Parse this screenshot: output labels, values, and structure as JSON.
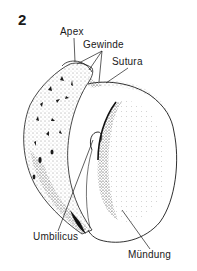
{
  "figure": {
    "number": "2",
    "labels": {
      "apex": "Apex",
      "gewinde": "Gewinde",
      "sutura": "Sutura",
      "umbilicus": "Umbilicus",
      "muendung": "Mündung"
    }
  },
  "colors": {
    "ink": "#1a1a1a",
    "background": "#ffffff"
  }
}
